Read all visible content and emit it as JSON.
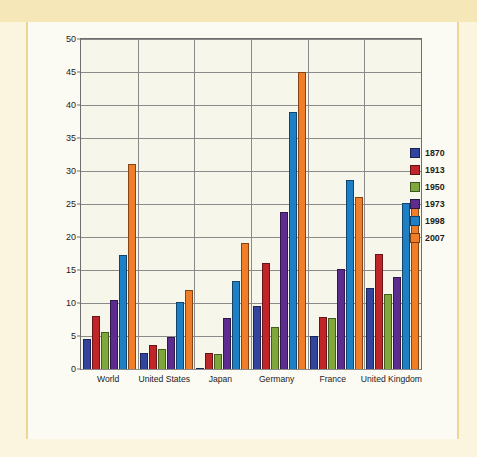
{
  "figure": {
    "background_color": "#fbfaf3",
    "frame_color": "#f6e7b9",
    "plot_background": "#f7f6ea"
  },
  "chart_data": {
    "type": "bar",
    "title": "",
    "subtitle": "",
    "xlabel": "",
    "ylabel": "Exports as Percent of GDP",
    "ylim": [
      0,
      50
    ],
    "ytick_step": 5,
    "yticks": [
      "0",
      "5",
      "10",
      "15",
      "20",
      "25",
      "30",
      "35",
      "40",
      "45",
      "50"
    ],
    "grid": true,
    "legend_position": "right",
    "categories": [
      "World",
      "United States",
      "Japan",
      "Germany",
      "France",
      "United Kingdom"
    ],
    "series": [
      {
        "name": "1870",
        "color": "#33449e",
        "values": [
          4.6,
          2.5,
          0.2,
          9.6,
          5.0,
          12.3
        ]
      },
      {
        "name": "1913",
        "color": "#c0252a",
        "values": [
          8.0,
          3.7,
          2.4,
          16.0,
          7.9,
          17.5
        ]
      },
      {
        "name": "1950",
        "color": "#7fa83c",
        "values": [
          5.6,
          3.0,
          2.2,
          6.3,
          7.7,
          11.3
        ]
      },
      {
        "name": "1973",
        "color": "#5c2d8e",
        "values": [
          10.5,
          4.9,
          7.7,
          23.8,
          15.2,
          14.0
        ]
      },
      {
        "name": "1998",
        "color": "#1f7fc4",
        "values": [
          17.2,
          10.1,
          13.4,
          38.9,
          28.7,
          25.1
        ]
      },
      {
        "name": "2007",
        "color": "#f07d28",
        "values": [
          31.0,
          12.0,
          19.1,
          45.0,
          26.0,
          25.1
        ]
      }
    ]
  }
}
